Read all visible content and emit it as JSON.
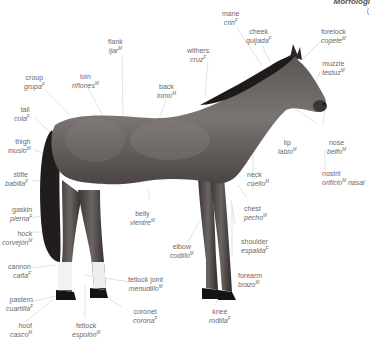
{
  "header": {
    "title_fragment": "Morfologí",
    "subtitle_fragment": "("
  },
  "colors": {
    "label_text": "#6a6a6a",
    "leader_line": "#d4d4d4",
    "horse_body": "#6b6563",
    "horse_dark": "#2a2726",
    "background": "#ffffff"
  },
  "labels": [
    {
      "id": "mane",
      "en": "mane",
      "es": "crin",
      "gender": "F"
    },
    {
      "id": "cheek",
      "en": "cheek",
      "es": "quijada",
      "gender": "F"
    },
    {
      "id": "forelock",
      "en": "forelock",
      "es": "copete",
      "gender": "M"
    },
    {
      "id": "flank",
      "en": "flank",
      "es": "ijar",
      "gender": "M"
    },
    {
      "id": "withers",
      "en": "withers",
      "es": "cruz",
      "gender": "F"
    },
    {
      "id": "muzzle",
      "en": "muzzle",
      "es": "testuz",
      "gender": "M"
    },
    {
      "id": "croup",
      "en": "croup",
      "es": "grupa",
      "gender": "F"
    },
    {
      "id": "loin",
      "en": "loin",
      "es": "riñones",
      "gender": "M"
    },
    {
      "id": "back",
      "en": "back",
      "es": "lomo",
      "gender": "M"
    },
    {
      "id": "tail",
      "en": "tail",
      "es": "cola",
      "gender": "F"
    },
    {
      "id": "thigh",
      "en": "thigh",
      "es": "muslo",
      "gender": "M"
    },
    {
      "id": "lip",
      "en": "lip",
      "es": "labio",
      "gender": "M"
    },
    {
      "id": "nose",
      "en": "nose",
      "es": "belfo",
      "gender": "M"
    },
    {
      "id": "stifle",
      "en": "stifle",
      "es": "babilla",
      "gender": "F"
    },
    {
      "id": "neck",
      "en": "neck",
      "es": "cuello",
      "gender": "M"
    },
    {
      "id": "nostril",
      "en": "nostril",
      "es": "orificio",
      "gender": "M",
      "es_suffix": "nasal"
    },
    {
      "id": "chest",
      "en": "chest",
      "es": "pecho",
      "gender": "M"
    },
    {
      "id": "gaskin",
      "en": "gaskin",
      "es": "pierna",
      "gender": "F"
    },
    {
      "id": "belly",
      "en": "belly",
      "es": "vientre",
      "gender": "M"
    },
    {
      "id": "hock",
      "en": "hock",
      "es": "corvejón",
      "gender": "M"
    },
    {
      "id": "shoulder",
      "en": "shoulder",
      "es": "espalda",
      "gender": "F"
    },
    {
      "id": "elbow",
      "en": "elbow",
      "es": "codillo",
      "gender": "M"
    },
    {
      "id": "cannon",
      "en": "cannon",
      "es": "caña",
      "gender": "F"
    },
    {
      "id": "forearm",
      "en": "forearm",
      "es": "brazo",
      "gender": "M"
    },
    {
      "id": "fetlock_joint",
      "en": "fetlock joint",
      "es": "menudillo",
      "gender": "M"
    },
    {
      "id": "pastern",
      "en": "pastern",
      "es": "cuartilla",
      "gender": "F"
    },
    {
      "id": "coronet",
      "en": "coronet",
      "es": "corona",
      "gender": "F"
    },
    {
      "id": "knee",
      "en": "knee",
      "es": "rodilla",
      "gender": "F"
    },
    {
      "id": "hoof",
      "en": "hoof",
      "es": "casco",
      "gender": "M"
    },
    {
      "id": "fetlock",
      "en": "fetlock",
      "es": "espolón",
      "gender": "M"
    }
  ]
}
